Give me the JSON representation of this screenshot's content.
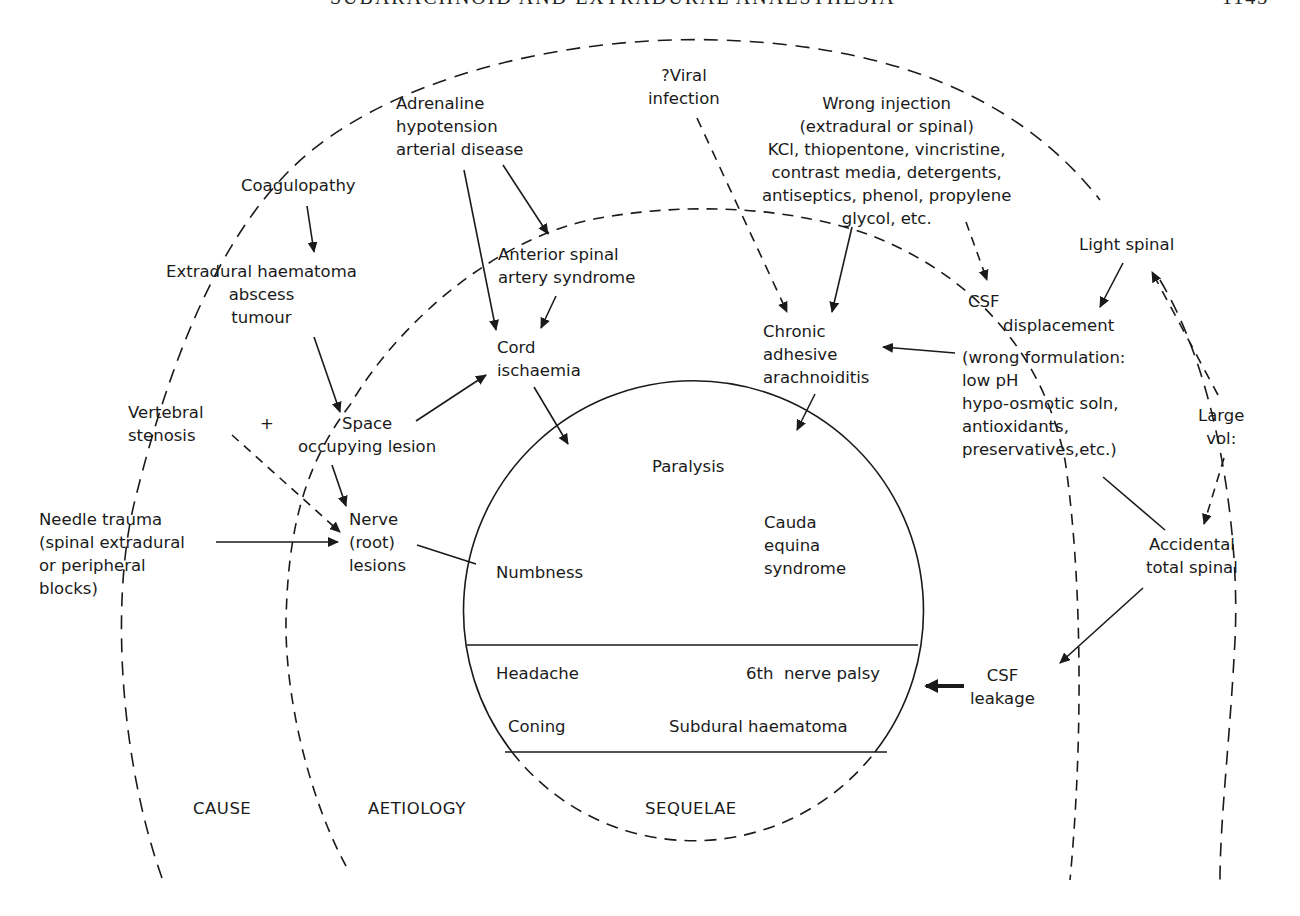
{
  "header": {
    "running_title": "SUBARACHNOID AND EXTRADURAL ANAESTHESIA",
    "page_number": "1143"
  },
  "regions": {
    "cause": "CAUSE",
    "aetiology": "AETIOLOGY",
    "sequelae": "SEQUELAE"
  },
  "causes": {
    "adrenaline": "Adrenaline\nhypotension\narterial disease",
    "viral": "?Viral\ninfection",
    "wrong_injection": "Wrong injection\n(extradural or spinal)\nKCl, thiopentone, vincristine,\ncontrast media, detergents,\nantiseptics, phenol, propylene\nglycol, etc.",
    "coagulopathy": "Coagulopathy",
    "light_spinal": "Light spinal",
    "vertebral_stenosis": "Vertebral\nstenosis",
    "plus": "+",
    "needle_trauma": "Needle trauma\n(spinal extradural\nor peripheral\nblocks)",
    "large_vol": "Large\nvol:"
  },
  "aetiology": {
    "extradural_haematoma": "Extradural haematoma\nabscess\ntumour",
    "anterior_spinal": "Anterior spinal\nartery syndrome",
    "cord_ischaemia": "Cord\nischaemia",
    "csf": "CSF",
    "displacement": "displacement",
    "chronic_arachnoiditis": "Chronic\nadhesive\narachnoiditis",
    "wrong_formulation": "(wrong formulation:\nlow pH\nhypo-osmotic soln,\nantioxidants,\npreservatives,etc.)",
    "space_occupying": "Space\noccupying lesion",
    "nerve_root": "Nerve\n(root)\nlesions",
    "accidental_total_spinal": "Accidental\ntotal spinal",
    "csf_leakage": "CSF\nleakage"
  },
  "sequelae": {
    "paralysis": "Paralysis",
    "cauda_equina": "Cauda\nequina\nsyndrome",
    "numbness": "Numbness",
    "headache": "Headache",
    "sixth_nerve": "6th  nerve palsy",
    "coning": "Coning",
    "subdural": "Subdural haematoma"
  },
  "colors": {
    "ink": "#1a1a1a",
    "background": "#ffffff"
  }
}
